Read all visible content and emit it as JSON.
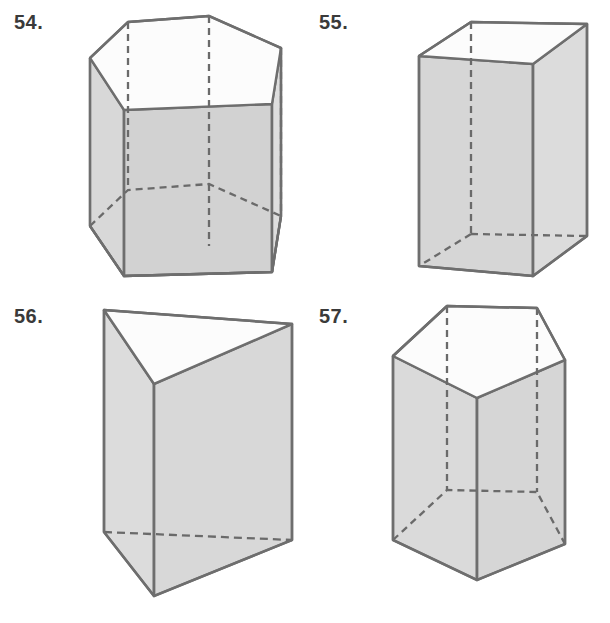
{
  "page": {
    "background_color": "#ffffff",
    "width": 610,
    "height": 623
  },
  "style": {
    "edge_color": "#6e6e6e",
    "edge_color_dark": "#595959",
    "face_light": "#f2f2f2",
    "face_shade": "#d6d6d6",
    "face_shade_dark": "#cccccc",
    "face_top": "#fbfbfb",
    "label_color": "#3a3a3a",
    "hidden_edge_color": "#6a6a6a",
    "edge_width": 2.4,
    "hidden_dash": "7 5"
  },
  "figures": [
    {
      "number": "54.",
      "label_name": "figure-number-54",
      "shape_name": "hexagonal-prism",
      "shape_description": "hexagonal prism",
      "faces_visible": 3,
      "hidden_edges": 3
    },
    {
      "number": "55.",
      "label_name": "figure-number-55",
      "shape_name": "rectangular-prism",
      "shape_description": "rectangular prism",
      "faces_visible": 3,
      "hidden_edges": 3
    },
    {
      "number": "56.",
      "label_name": "figure-number-56",
      "shape_name": "triangular-prism",
      "shape_description": "triangular prism",
      "faces_visible": 3,
      "hidden_edges": 1
    },
    {
      "number": "57.",
      "label_name": "figure-number-57",
      "shape_name": "pentagonal-prism",
      "shape_description": "pentagonal prism",
      "faces_visible": 3,
      "hidden_edges": 3
    }
  ]
}
